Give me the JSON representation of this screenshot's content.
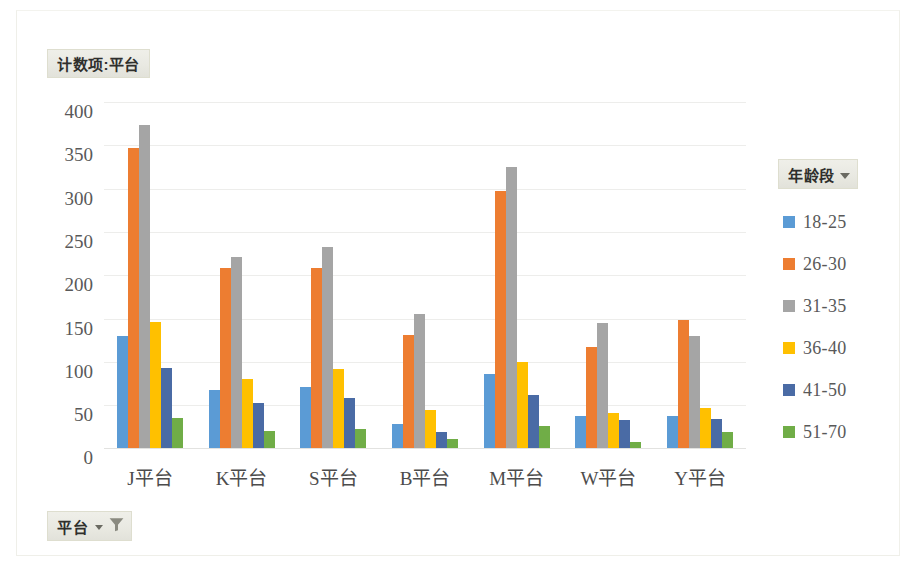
{
  "title_button": {
    "label": "计数项:平台"
  },
  "legend_field_button": {
    "label": "年龄段",
    "icon": "chevron-down-icon"
  },
  "row_field_button": {
    "label": "平台",
    "icons": [
      "chevron-down-icon",
      "filter-funnel-icon"
    ]
  },
  "chart_data": {
    "type": "bar",
    "title": "计数项:平台",
    "xlabel": "",
    "ylabel": "",
    "ylim": [
      0,
      400
    ],
    "yticks": [
      400,
      350,
      300,
      250,
      200,
      150,
      100,
      50,
      0
    ],
    "grid": true,
    "legend_position": "right",
    "legend_title": "年龄段",
    "categories": [
      "J平台",
      "K平台",
      "S平台",
      "B平台",
      "M平台",
      "W平台",
      "Y平台"
    ],
    "series": [
      {
        "name": "18-25",
        "color": "#5B9BD5",
        "values": [
          130,
          67,
          70,
          28,
          86,
          37,
          37
        ]
      },
      {
        "name": "26-30",
        "color": "#ED7D31",
        "values": [
          347,
          208,
          208,
          131,
          297,
          117,
          148
        ]
      },
      {
        "name": "31-35",
        "color": "#A5A5A5",
        "values": [
          373,
          221,
          232,
          155,
          325,
          144,
          129
        ]
      },
      {
        "name": "36-40",
        "color": "#FFC000",
        "values": [
          146,
          80,
          91,
          44,
          99,
          41,
          46
        ]
      },
      {
        "name": "41-50",
        "color": "#4A6BA5",
        "values": [
          93,
          52,
          58,
          18,
          61,
          32,
          33
        ]
      },
      {
        "name": "51-70",
        "color": "#70AD47",
        "values": [
          35,
          20,
          22,
          11,
          26,
          7,
          19
        ]
      }
    ]
  }
}
